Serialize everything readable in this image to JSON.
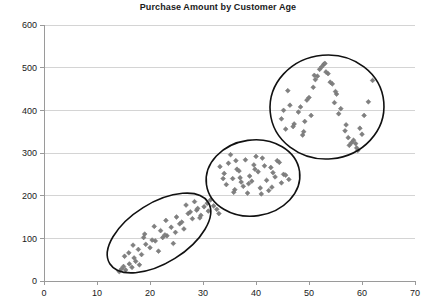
{
  "chart_data": {
    "type": "scatter",
    "title": "Purchase Amount by Customer Age",
    "xlabel": "",
    "ylabel": "",
    "xlim": [
      0,
      70
    ],
    "ylim": [
      0,
      600
    ],
    "xticks": [
      0,
      10,
      20,
      30,
      40,
      50,
      60,
      70
    ],
    "yticks": [
      0,
      100,
      200,
      300,
      400,
      500,
      600
    ],
    "grid": "horizontal",
    "legend": "none",
    "marker": "diamond",
    "marker_color": "#808080",
    "annotation_color": "#111111",
    "series": [
      {
        "name": "Customers",
        "x": [
          14.2,
          14.6,
          15.0,
          15.4,
          16.1,
          16.6,
          17.3,
          18.0,
          15.2,
          16.0,
          17.0,
          17.8,
          18.4,
          19.2,
          20.0,
          21.0,
          21.6,
          22.4,
          19.0,
          20.4,
          22.0,
          23.2,
          24.0,
          24.8,
          25.6,
          26.4,
          23.0,
          25.0,
          26.0,
          27.2,
          28.0,
          28.8,
          29.6,
          30.2,
          26.8,
          27.6,
          28.4,
          29.0,
          30.8,
          31.4,
          32.0,
          32.6,
          33.0,
          24.4,
          22.8,
          20.8,
          18.8,
          16.8,
          29.4,
          31.0
        ],
        "y": [
          22,
          28,
          34,
          26,
          40,
          32,
          46,
          38,
          58,
          66,
          54,
          74,
          62,
          86,
          78,
          94,
          70,
          102,
          110,
          96,
          118,
          106,
          126,
          114,
          134,
          122,
          142,
          150,
          138,
          158,
          146,
          166,
          154,
          174,
          178,
          162,
          186,
          170,
          182,
          190,
          176,
          168,
          158,
          88,
          108,
          128,
          102,
          84,
          148,
          164
        ]
      },
      {
        "name": "Customers",
        "x": [
          33.2,
          34.0,
          34.8,
          35.6,
          36.4,
          37.2,
          38.0,
          38.8,
          39.6,
          40.4,
          41.2,
          42.0,
          42.8,
          43.6,
          44.4,
          45.2,
          34.4,
          35.2,
          36.0,
          36.8,
          37.6,
          38.4,
          39.2,
          40.0,
          40.8,
          41.6,
          42.4,
          43.2,
          44.0,
          44.8,
          35.8,
          37.0,
          38.6,
          39.8,
          41.0,
          43.0,
          45.6,
          46.2,
          33.8,
          36.2
        ],
        "y": [
          268,
          252,
          276,
          240,
          262,
          232,
          284,
          246,
          272,
          256,
          288,
          236,
          266,
          244,
          278,
          250,
          226,
          296,
          214,
          258,
          222,
          206,
          234,
          292,
          218,
          270,
          212,
          254,
          282,
          230,
          208,
          242,
          228,
          262,
          204,
          220,
          248,
          238,
          240,
          282
        ]
      },
      {
        "name": "Customers",
        "x": [
          44.8,
          45.6,
          46.4,
          47.2,
          48.0,
          48.8,
          49.6,
          50.4,
          51.2,
          52.0,
          52.8,
          53.6,
          54.4,
          55.2,
          56.0,
          56.8,
          57.6,
          58.4,
          59.2,
          60.0,
          46.0,
          47.0,
          48.4,
          49.2,
          50.0,
          50.8,
          51.6,
          52.4,
          53.2,
          54.0,
          54.8,
          55.6,
          57.0,
          58.0,
          59.0,
          60.4,
          61.2,
          62.0,
          45.2,
          49.0,
          53.0,
          55.0,
          57.4,
          58.8,
          59.6,
          51.0
        ],
        "y": [
          380,
          356,
          412,
          368,
          396,
          342,
          424,
          388,
          472,
          496,
          508,
          486,
          462,
          438,
          404,
          352,
          318,
          330,
          306,
          344,
          446,
          362,
          408,
          374,
          430,
          454,
          480,
          502,
          490,
          466,
          418,
          392,
          366,
          324,
          312,
          388,
          420,
          470,
          400,
          350,
          510,
          444,
          336,
          322,
          358,
          482
        ]
      }
    ],
    "annotations": [
      {
        "shape": "ellipse",
        "label": "cluster-young-low-spend",
        "cx": 159,
        "cy": 233,
        "rx": 58,
        "ry": 30,
        "rotation": -32
      },
      {
        "shape": "ellipse",
        "label": "cluster-mid-age-mid-spend",
        "cx": 253,
        "cy": 178,
        "rx": 47,
        "ry": 38,
        "rotation": -8
      },
      {
        "shape": "ellipse",
        "label": "cluster-older-high-spend",
        "cx": 327,
        "cy": 107,
        "rx": 57,
        "ry": 52,
        "rotation": -5
      }
    ]
  }
}
